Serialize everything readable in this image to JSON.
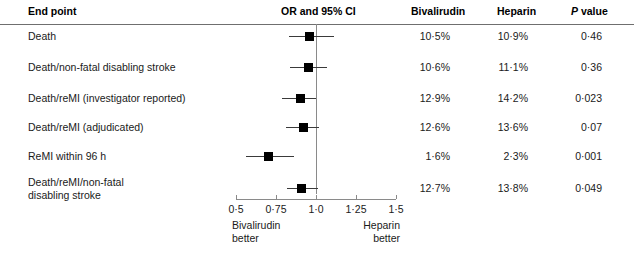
{
  "figure": {
    "type": "forest-plot",
    "headers": {
      "endpoint": "End point",
      "or_ci": "OR and 95% CI",
      "bivalirudin": "Bivalirudin",
      "heparin": "Heparin",
      "p_value_italic": "P",
      "p_value_rest": " value"
    },
    "axis": {
      "tick_labels": [
        "0·5",
        "0·75",
        "1·0",
        "1·25",
        "1·5"
      ],
      "tick_values": [
        0.5,
        0.75,
        1.0,
        1.25,
        1.5
      ],
      "min": 0.5,
      "max": 1.5,
      "null_value": 1.0,
      "left_note": "Bivalirudin\nbetter",
      "right_note": "Heparin\nbetter"
    },
    "rows": [
      {
        "label": "Death",
        "or": 0.96,
        "ci_low": 0.83,
        "ci_high": 1.11,
        "bivalirudin": "10·5%",
        "heparin": "10·9%",
        "p": "0·46"
      },
      {
        "label": "Death/non-fatal disabling stroke",
        "or": 0.95,
        "ci_low": 0.84,
        "ci_high": 1.07,
        "bivalirudin": "10·6%",
        "heparin": "11·1%",
        "p": "0·36"
      },
      {
        "label": "Death/reMI (investigator reported)",
        "or": 0.9,
        "ci_low": 0.79,
        "ci_high": 1.0,
        "bivalirudin": "12·9%",
        "heparin": "14·2%",
        "p": "0·023"
      },
      {
        "label": "Death/reMI (adjudicated)",
        "or": 0.92,
        "ci_low": 0.81,
        "ci_high": 1.02,
        "bivalirudin": "12·6%",
        "heparin": "13·6%",
        "p": "0·07"
      },
      {
        "label": "ReMI within 96 h",
        "or": 0.7,
        "ci_low": 0.56,
        "ci_high": 0.86,
        "bivalirudin": "1·6%",
        "heparin": "2·3%",
        "p": "0·001"
      },
      {
        "label": "Death/reMI/non-fatal\ndisabling stroke",
        "or": 0.91,
        "ci_low": 0.82,
        "ci_high": 1.01,
        "bivalirudin": "12·7%",
        "heparin": "13·8%",
        "p": "0·049"
      }
    ]
  },
  "chart_data": {
    "type": "scatter",
    "title": "OR and 95% CI",
    "xlabel": "",
    "ylabel": "End point",
    "xlim": [
      0.5,
      1.5
    ],
    "xticks": [
      0.5,
      0.75,
      1.0,
      1.25,
      1.5
    ],
    "xtick_labels": [
      "0·5",
      "0·75",
      "1·0",
      "1·25",
      "1·5"
    ],
    "grid": false,
    "legend": "none",
    "reference_line": 1.0,
    "annotations": [
      "Bivalirudin better",
      "Heparin better"
    ],
    "categories": [
      "Death",
      "Death/non-fatal disabling stroke",
      "Death/reMI (investigator reported)",
      "Death/reMI (adjudicated)",
      "ReMI within 96 h",
      "Death/reMI/non-fatal disabling stroke"
    ],
    "series": [
      {
        "name": "Odds ratio",
        "values": [
          0.96,
          0.95,
          0.9,
          0.92,
          0.7,
          0.91
        ]
      },
      {
        "name": "95% CI lower",
        "values": [
          0.83,
          0.84,
          0.79,
          0.81,
          0.56,
          0.82
        ]
      },
      {
        "name": "95% CI upper",
        "values": [
          1.11,
          1.07,
          1.0,
          1.02,
          0.86,
          1.01
        ]
      },
      {
        "name": "Bivalirudin %",
        "values": [
          10.5,
          10.6,
          12.9,
          12.6,
          1.6,
          12.7
        ]
      },
      {
        "name": "Heparin %",
        "values": [
          10.9,
          11.1,
          14.2,
          13.6,
          2.3,
          13.8
        ]
      },
      {
        "name": "P value",
        "values": [
          0.46,
          0.36,
          0.023,
          0.07,
          0.001,
          0.049
        ]
      }
    ]
  }
}
